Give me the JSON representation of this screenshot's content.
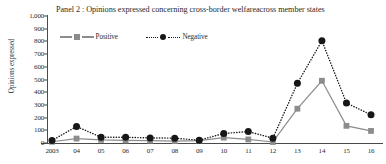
{
  "chart_data": {
    "type": "line",
    "title": "Panel 2 : Opinions expressed concerning cross-border welfareacross member states",
    "xlabel": "",
    "ylabel": "Opinions expressed",
    "categories": [
      "2003",
      "04",
      "05",
      "06",
      "07",
      "08",
      "09",
      "10",
      "11",
      "12",
      "13",
      "14",
      "15",
      "16"
    ],
    "ylim": [
      0,
      1000
    ],
    "ytick_labels": [
      "0",
      "100",
      "200",
      "300",
      "400",
      "500",
      "600",
      "700",
      "800",
      "900",
      "1,000"
    ],
    "ytick_values": [
      0,
      100,
      200,
      300,
      400,
      500,
      600,
      700,
      800,
      900,
      1000
    ],
    "grid": false,
    "legend_position": "upper-left-inside",
    "series": [
      {
        "name": "Positive",
        "marker": "square",
        "linestyle": "solid",
        "color": "#8c8c8c",
        "values": [
          10,
          35,
          25,
          20,
          18,
          15,
          18,
          42,
          28,
          8,
          270,
          490,
          135,
          95
        ]
      },
      {
        "name": "Negative",
        "marker": "circle",
        "linestyle": "dotted",
        "color": "#171717",
        "values": [
          20,
          130,
          45,
          45,
          40,
          38,
          22,
          75,
          90,
          38,
          470,
          805,
          315,
          222
        ]
      }
    ]
  },
  "colors": {
    "positive": "#8c8c8c",
    "negative": "#171717",
    "axis": "#4a4a4a",
    "background": "#ffffff"
  }
}
